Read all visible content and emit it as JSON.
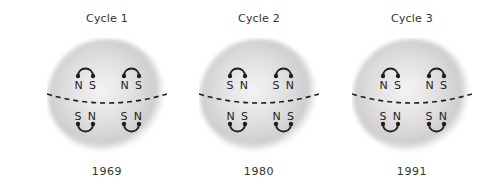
{
  "figure": {
    "panels": [
      {
        "title": "Cycle 1",
        "year": "1969",
        "north_hemisphere": {
          "left": "N S",
          "right": "N S"
        },
        "south_hemisphere": {
          "left": "S N",
          "right": "S N"
        }
      },
      {
        "title": "Cycle 2",
        "year": "1980",
        "north_hemisphere": {
          "left": "S N",
          "right": "S N"
        },
        "south_hemisphere": {
          "left": "N S",
          "right": "N S"
        }
      },
      {
        "title": "Cycle 3",
        "year": "1991",
        "north_hemisphere": {
          "left": "N S",
          "right": "N S"
        },
        "south_hemisphere": {
          "left": "S N",
          "right": "S N"
        }
      }
    ],
    "colors": {
      "sphere_light": "#f2f2f2",
      "sphere_mid": "#d6d6d6",
      "sphere_edge": "#c4c4c4",
      "ink": "#1e1e1e"
    }
  }
}
